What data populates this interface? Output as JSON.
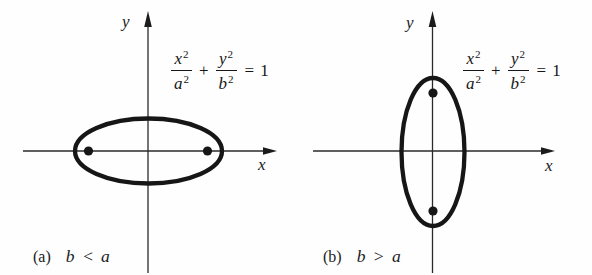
{
  "figure": {
    "background": "#fefefe",
    "ink_color": "#1b1b1b",
    "panels": [
      {
        "id": "a",
        "caption_label": "(a)",
        "caption_condition": "b < a",
        "x_axis_label": "x",
        "y_axis_label": "y",
        "equation": {
          "terms": {
            "x": "x",
            "x_exp": "2",
            "a": "a",
            "a_exp": "2",
            "plus": "+",
            "y": "y",
            "y_exp": "2",
            "b": "b",
            "b_exp": "2",
            "equals": "=",
            "one": "1"
          }
        }
      },
      {
        "id": "b",
        "caption_label": "(b)",
        "caption_condition": "b > a",
        "x_axis_label": "x",
        "y_axis_label": "y",
        "equation": {
          "terms": {
            "x": "x",
            "x_exp": "2",
            "a": "a",
            "a_exp": "2",
            "plus": "+",
            "y": "y",
            "y_exp": "2",
            "b": "b",
            "b_exp": "2",
            "equals": "=",
            "one": "1"
          }
        }
      }
    ]
  }
}
